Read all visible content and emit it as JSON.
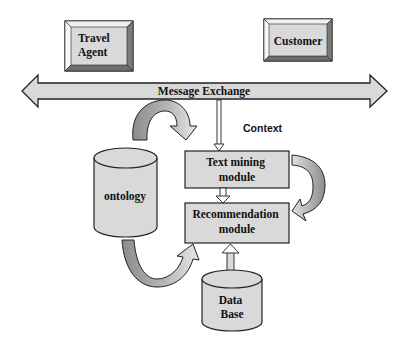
{
  "diagram": {
    "actors": [
      {
        "id": "travel_agent",
        "lines": [
          "Travel",
          "Agent"
        ]
      },
      {
        "id": "customer",
        "lines": [
          "Customer"
        ]
      }
    ],
    "message_bar": {
      "label": "Message Exchange"
    },
    "context_label": "Context",
    "modules": [
      {
        "id": "text_mining",
        "lines": [
          "Text mining",
          "module"
        ]
      },
      {
        "id": "recommendation",
        "lines": [
          "Recommendation",
          "module"
        ]
      }
    ],
    "stores": [
      {
        "id": "ontology",
        "lines": [
          "ontology"
        ]
      },
      {
        "id": "database",
        "lines": [
          "Data",
          "Base"
        ]
      }
    ],
    "edges": [
      {
        "from": "Message Exchange",
        "to": "Text mining module",
        "style": "thin arrow",
        "label": "Context"
      },
      {
        "from": "Message Exchange",
        "to": "Text mining module",
        "style": "curved arrow via ontology side"
      },
      {
        "from": "Text mining module",
        "to": "Recommendation module",
        "style": "hollow arrow"
      },
      {
        "from": "Text mining module",
        "to": "Recommendation module",
        "style": "curved arrow right side"
      },
      {
        "from": "ontology",
        "to": "Recommendation module",
        "style": "curved arrow bottom"
      },
      {
        "from": "Data Base",
        "to": "Recommendation module",
        "style": "hollow arrow"
      }
    ],
    "colors": {
      "fill": "#d9d9d9",
      "bevel_light": "#f2f2f2",
      "bevel_dark": "#7f7f7f",
      "curve_dark": "#8c8c8c",
      "curve_light": "#e6e6e6",
      "stroke": "#222222"
    }
  }
}
